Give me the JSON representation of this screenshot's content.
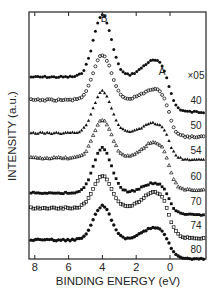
{
  "chart_data": {
    "type": "line",
    "title": "",
    "xlabel": "BINDING  ENERGY (eV)",
    "ylabel": "INTENSITY (a.u.)",
    "x_ticks": [
      "8",
      "6",
      "4",
      "2",
      "0"
    ],
    "xlim": [
      8.4,
      -1.8
    ],
    "x_reversed": true,
    "grid": false,
    "peak_labels": [
      {
        "label": "B",
        "x": 4.0
      },
      {
        "label": "A",
        "x": 0.6
      }
    ],
    "series": [
      {
        "name": "×05",
        "marker": "filled-circle",
        "baseline_left": 77,
        "baseline_right": 112,
        "x": [
          8.2,
          7,
          6,
          5.3,
          4.8,
          4.4,
          4.1,
          3.9,
          3.6,
          3.3,
          3.0,
          2.6,
          2.2,
          1.8,
          1.4,
          1.0,
          0.6,
          0.3,
          0.1,
          -0.2,
          -1.8
        ],
        "y": [
          0,
          0.5,
          0,
          0.5,
          2,
          6,
          13,
          16,
          13,
          7,
          2,
          -4,
          -6,
          -5,
          -3,
          -1,
          0,
          -6,
          -22,
          -35,
          -35
        ]
      },
      {
        "name": "40",
        "marker": "open-circle",
        "baseline_left": 100,
        "baseline_right": 137
      },
      {
        "name": "50",
        "marker": "filled-triangle",
        "baseline_left": 133,
        "baseline_right": 159
      },
      {
        "name": "54",
        "marker": "open-triangle",
        "baseline_left": 158,
        "baseline_right": 190
      },
      {
        "name": "60",
        "marker": "filled-square",
        "baseline_left": 193,
        "baseline_right": 214
      },
      {
        "name": "70",
        "marker": "open-square",
        "baseline_left": 208,
        "baseline_right": 238
      },
      {
        "name": "74",
        "marker": "filled-star",
        "baseline_left": 240,
        "baseline_right": 258
      }
    ],
    "series_labels": [
      "×05",
      "40",
      "50",
      "54",
      "60",
      "70",
      "74",
      "80"
    ]
  }
}
